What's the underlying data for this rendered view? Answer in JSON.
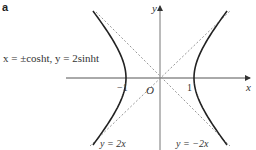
{
  "figure": {
    "panel_label": "a",
    "axis_x_label": "x",
    "axis_y_label": "y",
    "origin_label": "O",
    "tick_neg": "−1",
    "tick_pos": "1",
    "equation_label": "x = ±cosht, y = 2sinht",
    "asymptote_1_label": "y = 2x",
    "asymptote_2_label": "y = −2x"
  },
  "chart_data": {
    "type": "line",
    "title": "",
    "xlabel": "x",
    "ylabel": "y",
    "series": [
      {
        "name": "right branch",
        "param": "x = cosh t, y = 2 sinh t",
        "t_range": [
          -1.3,
          1.3
        ],
        "style": "solid"
      },
      {
        "name": "left branch",
        "param": "x = -cosh t, y = 2 sinh t",
        "t_range": [
          -1.3,
          1.3
        ],
        "style": "solid"
      },
      {
        "name": "asymptote y = 2x",
        "slope": 2,
        "style": "dashed"
      },
      {
        "name": "asymptote y = -2x",
        "slope": -2,
        "style": "dashed"
      }
    ],
    "x_ticks": [
      -1,
      1
    ],
    "grid": false
  }
}
